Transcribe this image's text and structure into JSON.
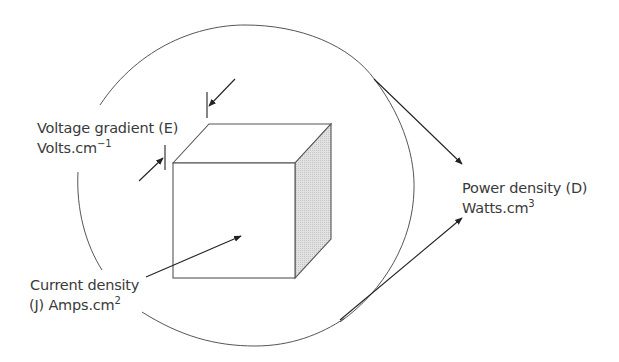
{
  "diagram": {
    "type": "cube-in-circle",
    "colors": {
      "stroke": "#555555",
      "arrow": "#222222",
      "shaded_face": "#d8d8d8",
      "text": "#3a3a3a",
      "background": "#ffffff"
    },
    "labels": {
      "voltage": {
        "line1": "Voltage gradient (E)",
        "line2_base": "Volts.cm",
        "line2_sup": "−1"
      },
      "current": {
        "line1": "Current density",
        "line2_base": "(J) Amps.cm",
        "line2_sup": "2"
      },
      "power": {
        "line1": "Power density (D)",
        "line2_base": "Watts.cm",
        "line2_sup": "3"
      }
    }
  }
}
